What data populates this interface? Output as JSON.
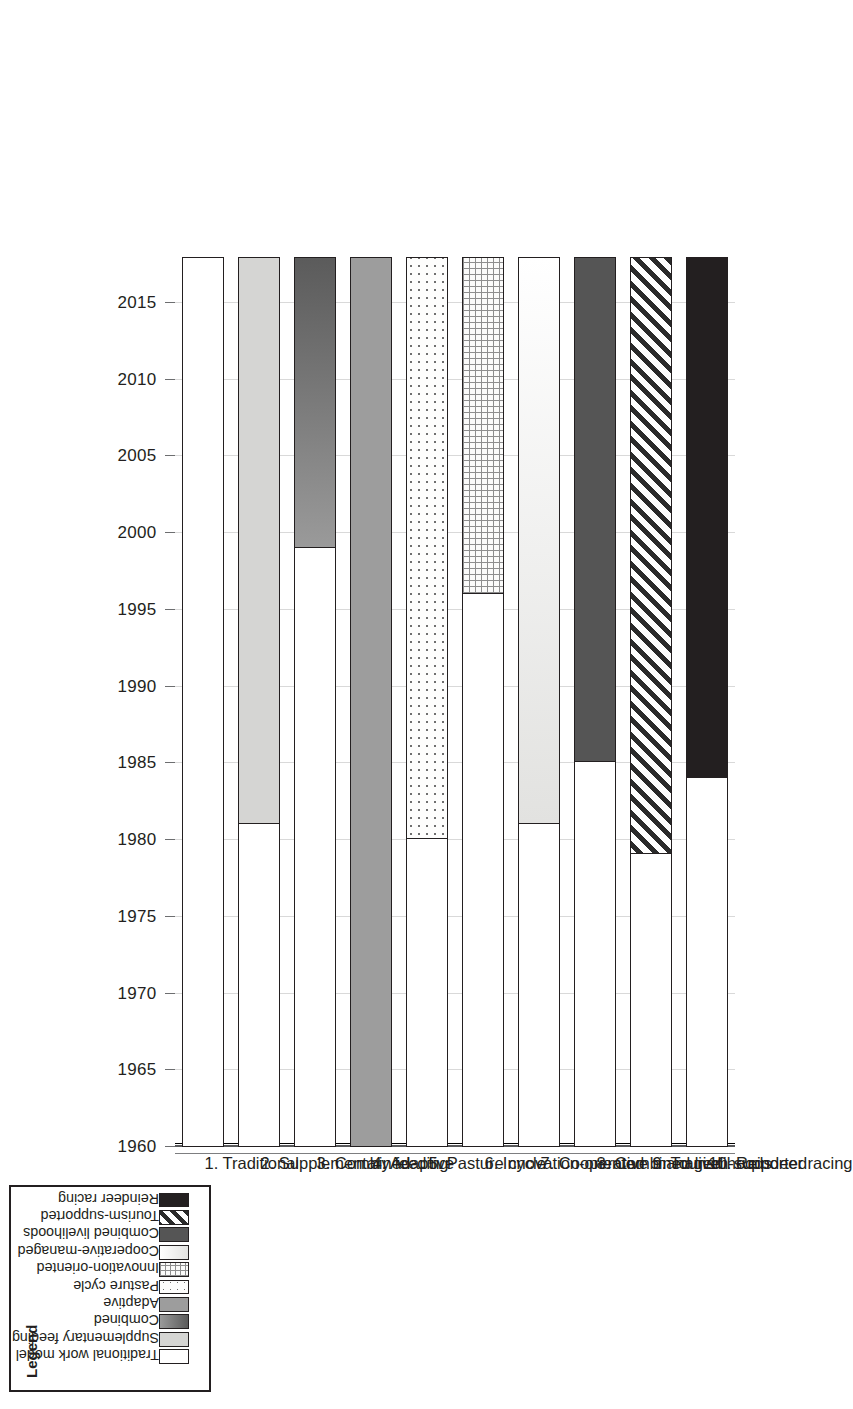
{
  "chart_data": {
    "type": "bar",
    "orientation": "rotated-90-horizontal-gantt",
    "title": "",
    "xlabel": "",
    "ylabel": "",
    "axis": {
      "name": "year",
      "min": 1960,
      "max": 2018,
      "tick_step": 5,
      "tick_labels": [
        "1960",
        "1965",
        "1970",
        "1975",
        "1980",
        "1985",
        "1990",
        "1995",
        "2000",
        "2005",
        "2010",
        "2015"
      ],
      "tick_values": [
        1960,
        1965,
        1970,
        1975,
        1980,
        1985,
        1990,
        1995,
        2000,
        2005,
        2010,
        2015
      ],
      "grid": true,
      "end_value": 2018
    },
    "categories": [
      "1. Traditional",
      "2. Supplementary feeding",
      "3. Combined",
      "4. Adaptive",
      "5. Pasture cycle",
      "6. Innovation-oriented",
      "7. Cooperative managed",
      "8. Combined livelihoods",
      "9. Tourism-supported",
      "10. Reindeer racing"
    ],
    "series": [
      {
        "name": "start_year",
        "description": "Year the work model emerged; bar is filled from this year to 2018",
        "values": [
          1960,
          1981,
          1999,
          1960,
          1980,
          1996,
          1981,
          1985,
          1979,
          1984
        ]
      },
      {
        "name": "end_year",
        "values": [
          2018,
          2018,
          2018,
          2018,
          2018,
          2018,
          2018,
          2018,
          2018,
          2018
        ]
      },
      {
        "name": "duration_years",
        "values": [
          58,
          37,
          19,
          58,
          38,
          22,
          37,
          33,
          39,
          34
        ]
      }
    ],
    "bar_fills": [
      "traditional-white",
      "supplementary-feeding-light-grey",
      "combined-dark-gradient",
      "adaptive-mid-grey",
      "pasture-cycle-dotted",
      "innovation-oriented-crosshatch",
      "cooperative-managed-pale-gradient",
      "combined-livelihoods-dark-grey",
      "tourism-supported-diagonal-hatch",
      "reindeer-racing-black"
    ],
    "legend_position": "bottom-left"
  },
  "axis": {
    "ticks": [
      {
        "label": "1960",
        "value": 1960
      },
      {
        "label": "1965",
        "value": 1965
      },
      {
        "label": "1970",
        "value": 1970
      },
      {
        "label": "1975",
        "value": 1975
      },
      {
        "label": "1980",
        "value": 1980
      },
      {
        "label": "1985",
        "value": 1985
      },
      {
        "label": "1990",
        "value": 1990
      },
      {
        "label": "1995",
        "value": 1995
      },
      {
        "label": "2000",
        "value": 2000
      },
      {
        "label": "2005",
        "value": 2005
      },
      {
        "label": "2010",
        "value": 2010
      },
      {
        "label": "2015",
        "value": 2015
      }
    ]
  },
  "bars": [
    {
      "label": "1. Traditional",
      "start": 1960,
      "fill": "white"
    },
    {
      "label": "2. Supplementary feeding",
      "start": 1981,
      "fill": "suppfeed"
    },
    {
      "label": "3. Combined",
      "start": 1999,
      "fill": "combined"
    },
    {
      "label": "4. Adaptive",
      "start": 1960,
      "fill": "adaptive"
    },
    {
      "label": "5. Pasture cycle",
      "start": 1980,
      "fill": "pasture"
    },
    {
      "label": "6. Innovation-oriented",
      "start": 1996,
      "fill": "innov"
    },
    {
      "label": "7. Cooperative managed",
      "start": 1981,
      "fill": "coop"
    },
    {
      "label": "8. Combined livelihoods",
      "start": 1985,
      "fill": "comliv"
    },
    {
      "label": "9. Tourism-supported",
      "start": 1979,
      "fill": "tourism"
    },
    {
      "label": "10. Reindeer racing",
      "start": 1984,
      "fill": "racing"
    }
  ],
  "legend": {
    "title": "Legend",
    "items": [
      {
        "label": "Traditional work model",
        "swatch": "white"
      },
      {
        "label": "Supplementary feeding",
        "swatch": "suppfeed"
      },
      {
        "label": "Combined",
        "swatch": "combined"
      },
      {
        "label": "Adaptive",
        "swatch": "adaptive"
      },
      {
        "label": "Pasture cycle",
        "swatch": "pasture"
      },
      {
        "label": "Innovation-oriented",
        "swatch": "innov"
      },
      {
        "label": "Cooperative-managed",
        "swatch": "coop"
      },
      {
        "label": "Combined livelihoods",
        "swatch": "comliv"
      },
      {
        "label": "Tourism-supported",
        "swatch": "tourism"
      },
      {
        "label": "Reindeer racing",
        "swatch": "racing"
      }
    ]
  },
  "colors": {
    "ink": "#231f20",
    "grid": "#d9d9d9",
    "axis": "#58595b",
    "background": "#ffffff"
  }
}
